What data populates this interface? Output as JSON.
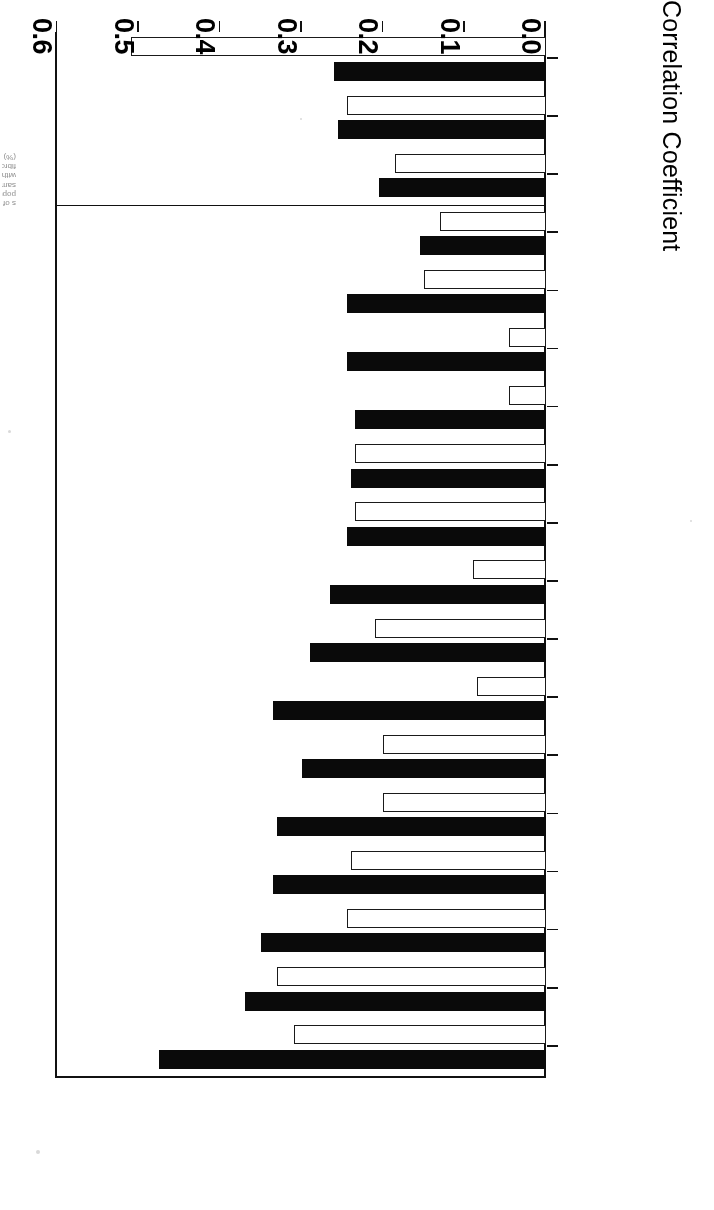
{
  "figure": {
    "rotation": "180deg",
    "caption_fragment": "s of population samples with fibromyalgia (%)"
  },
  "axis": {
    "title": "Correlation Coefficient",
    "ticks": [
      "0.0",
      "0.1",
      "0.2",
      "0.3",
      "0.4",
      "0.5",
      "0.6"
    ],
    "min": 0.0,
    "max": 0.6
  },
  "colors": {
    "series_a": "#0a0a0a",
    "series_b": "#ffffff",
    "line": "#111111",
    "background": "#ffffff"
  },
  "chart_data": {
    "type": "bar",
    "title": "",
    "subtitle": "",
    "xlabel": "",
    "ylabel": "Correlation Coefficient",
    "ylim": [
      0.0,
      0.6
    ],
    "grid": false,
    "orientation": "horizontal",
    "legend": "none",
    "categories": [
      "HAQ",
      "Pain All Over",
      "VAS Pain",
      "Satisfaction",
      "VAS Severity",
      "Health Status",
      "Paresthesia",
      "Stiffness",
      "Jt. Swelling",
      "Fatigue",
      "IBS",
      "Age",
      "AIMS Depression",
      "SCL-90 Depression",
      "SCL-90 Anxiety",
      "Sleep Disturbance",
      "AIMS Anxiety",
      "Sex"
    ],
    "series": [
      {
        "name": "solid",
        "fill": "#0a0a0a",
        "values": [
          0.475,
          0.37,
          0.35,
          0.335,
          0.33,
          0.3,
          0.335,
          0.29,
          0.265,
          0.245,
          0.24,
          0.235,
          0.245,
          0.245,
          0.155,
          0.205,
          0.255,
          0.26
        ]
      },
      {
        "name": "open",
        "fill": "#ffffff",
        "values": [
          0.31,
          0.33,
          0.245,
          0.24,
          0.2,
          0.2,
          0.085,
          0.21,
          0.09,
          0.235,
          0.235,
          0.045,
          0.045,
          0.15,
          0.13,
          0.185,
          0.245,
          0.51
        ]
      }
    ],
    "divider_after_category": "SCL-90 Anxiety"
  }
}
